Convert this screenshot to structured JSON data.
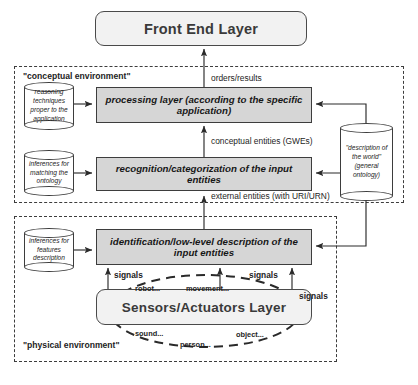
{
  "diagram": {
    "colors": {
      "gray_box_fill": "#d6d6d6",
      "layer_box_fill": "#f2f2f2",
      "stroke": "#3d3d3d",
      "background": "#ffffff"
    }
  },
  "front_end": {
    "label": "Front End Layer"
  },
  "conceptual_environment": {
    "label": "\"conceptual environment\"",
    "processing_layer": "processing layer (according to the specific application)",
    "recognition_layer": "recognition/categorization of the input entities",
    "datastores": [
      {
        "label": "reasoning techniques proper to the application"
      },
      {
        "label": "inferences for matching the ontology"
      }
    ],
    "edges": [
      {
        "label": "orders/results"
      },
      {
        "label": "conceptual entities (GWEs)"
      },
      {
        "label": "external entities (with URI/URN)"
      }
    ]
  },
  "physical_environment": {
    "label": "\"physical environment\"",
    "identification_layer": "identification/low-level description of the input entities",
    "sensors_layer": "Sensors/Actuators Layer",
    "datastores": [
      {
        "label": "inferences for features description"
      }
    ],
    "signal_labels": [
      "signals",
      "signals",
      "signals"
    ],
    "world_items": [
      {
        "label": "robot..."
      },
      {
        "label": "movement..."
      },
      {
        "label": "sound..."
      },
      {
        "label": "person..."
      },
      {
        "label": "object..."
      }
    ]
  },
  "ontology_store": {
    "label": "\"description of the world\" (general ontology)"
  }
}
